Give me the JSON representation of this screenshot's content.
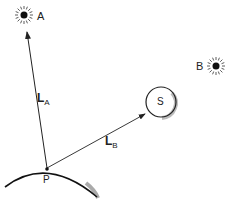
{
  "diagram": {
    "labels": {
      "star_a": "A",
      "star_b": "B",
      "sun": "S",
      "point": "P",
      "vector_a_main": "L",
      "vector_a_sub": "A",
      "vector_b_main": "L",
      "vector_b_sub": "B"
    },
    "colors": {
      "stroke": "#222222",
      "background": "#ffffff"
    }
  }
}
